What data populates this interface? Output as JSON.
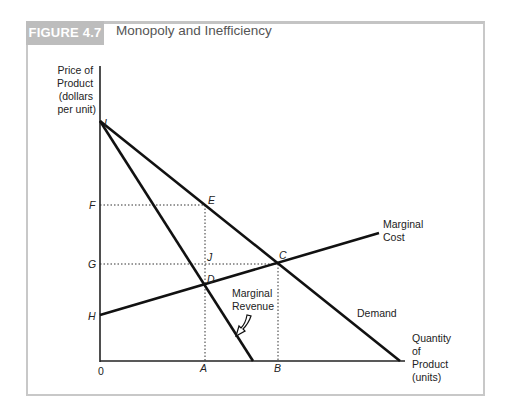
{
  "figure": {
    "label": "FIGURE 4.7",
    "title": "Monopoly and Inefficiency"
  },
  "axes": {
    "y_label_lines": [
      "Price of",
      "Product",
      "(dollars",
      "per unit)"
    ],
    "x_label_lines": [
      "Quantity",
      "of",
      "Product",
      "(units)"
    ],
    "origin": "0"
  },
  "points": {
    "I": "I",
    "E": "E",
    "F": "F",
    "G": "G",
    "H": "H",
    "J": "J",
    "C": "C",
    "D": "D",
    "A": "A",
    "B": "B"
  },
  "curves": {
    "marginal_cost_lines": [
      "Marginal",
      "Cost"
    ],
    "marginal_revenue_lines": [
      "Marginal",
      "Revenue"
    ],
    "demand": "Demand"
  }
}
